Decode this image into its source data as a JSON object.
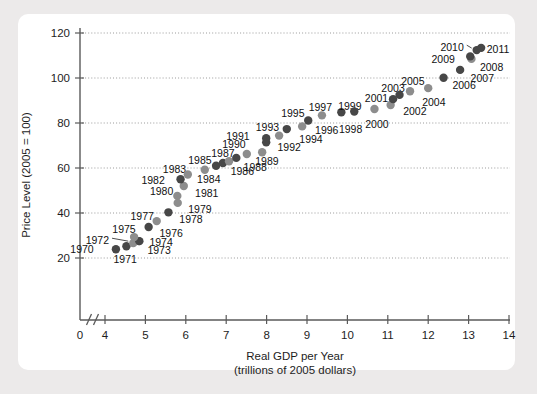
{
  "figure": {
    "background_color": "#eceaea",
    "panel_color": "#ffffff"
  },
  "chart_data": {
    "type": "scatter",
    "title": "",
    "xlabel": "Real GDP per Year",
    "xlabel_sub": "(trillions of 2005 dollars)",
    "ylabel": "Price Level (2005 = 100)",
    "xlim": [
      0,
      14
    ],
    "ylim": [
      0,
      124
    ],
    "x_axis_break": true,
    "x_break_after": 0,
    "x_data_start": 4,
    "grid": "horizontal-dotted",
    "legend": "none",
    "xticks": [
      0,
      4,
      5,
      6,
      7,
      8,
      9,
      10,
      11,
      12,
      13,
      14
    ],
    "xticklabels": [
      "0",
      "4",
      "5",
      "6",
      "7",
      "8",
      "9",
      "10",
      "11",
      "12",
      "13",
      "14"
    ],
    "yticks": [
      20,
      40,
      60,
      80,
      100,
      120
    ],
    "yticklabels": [
      "20",
      "40",
      "60",
      "80",
      "100",
      "120"
    ],
    "colors": {
      "dot_dark": "#474747",
      "dot_light": "#8d8d8d",
      "axis": "#5a5a5a",
      "grid": "#9a9a9a",
      "text": "#111111"
    },
    "points": [
      {
        "label": "1970",
        "x": 4.27,
        "y": 23.9,
        "shade": "dark",
        "lx": 3.72,
        "ly": 23.9,
        "anchor": "end",
        "leader": false
      },
      {
        "label": "1971",
        "x": 4.53,
        "y": 25.2,
        "shade": "dark",
        "lx": 4.5,
        "ly": 19.6,
        "anchor": "middle",
        "leader": false
      },
      {
        "label": "1972",
        "x": 4.7,
        "y": 26.6,
        "shade": "light",
        "lx": 4.1,
        "ly": 27.9,
        "anchor": "end",
        "leader": true
      },
      {
        "label": "1973",
        "x": 4.84,
        "y": 27.5,
        "shade": "light",
        "lx": 5.05,
        "ly": 23.6,
        "anchor": "start",
        "leader": false
      },
      {
        "label": "1974",
        "x": 4.85,
        "y": 27.5,
        "shade": "dark",
        "lx": 5.1,
        "ly": 27.3,
        "anchor": "start",
        "leader": false
      },
      {
        "label": "1975",
        "x": 4.72,
        "y": 29.3,
        "shade": "light",
        "lx": 4.47,
        "ly": 32.8,
        "anchor": "middle",
        "leader": false
      },
      {
        "label": "1976",
        "x": 5.08,
        "y": 33.8,
        "shade": "dark",
        "lx": 5.35,
        "ly": 30.9,
        "anchor": "start",
        "leader": false
      },
      {
        "label": "1977",
        "x": 5.28,
        "y": 36.4,
        "shade": "light",
        "lx": 4.92,
        "ly": 38.5,
        "anchor": "middle",
        "leader": false
      },
      {
        "label": "1978",
        "x": 5.57,
        "y": 40.3,
        "shade": "dark",
        "lx": 5.84,
        "ly": 37.4,
        "anchor": "start",
        "leader": false
      },
      {
        "label": "1979",
        "x": 5.8,
        "y": 44.5,
        "shade": "light",
        "lx": 6.06,
        "ly": 41.7,
        "anchor": "start",
        "leader": false
      },
      {
        "label": "1980",
        "x": 5.79,
        "y": 47.6,
        "shade": "light",
        "lx": 5.4,
        "ly": 49.8,
        "anchor": "middle",
        "leader": false
      },
      {
        "label": "1981",
        "x": 5.95,
        "y": 52.0,
        "shade": "light",
        "lx": 6.23,
        "ly": 49.1,
        "anchor": "start",
        "leader": false
      },
      {
        "label": "1982",
        "x": 5.87,
        "y": 55.0,
        "shade": "dark",
        "lx": 5.48,
        "ly": 54.7,
        "anchor": "end",
        "leader": false
      },
      {
        "label": "1983",
        "x": 6.05,
        "y": 57.1,
        "shade": "light",
        "lx": 5.72,
        "ly": 59.5,
        "anchor": "middle",
        "leader": false
      },
      {
        "label": "1984",
        "x": 6.47,
        "y": 59.2,
        "shade": "light",
        "lx": 6.28,
        "ly": 55.2,
        "anchor": "start",
        "leader": false
      },
      {
        "label": "1985",
        "x": 6.75,
        "y": 61.0,
        "shade": "dark",
        "lx": 6.35,
        "ly": 63.4,
        "anchor": "middle",
        "leader": false
      },
      {
        "label": "1986",
        "x": 6.92,
        "y": 62.2,
        "shade": "dark",
        "lx": 7.11,
        "ly": 58.8,
        "anchor": "start",
        "leader": false
      },
      {
        "label": "1987",
        "x": 7.07,
        "y": 63.0,
        "shade": "light",
        "lx": 6.92,
        "ly": 66.8,
        "anchor": "middle",
        "leader": false
      },
      {
        "label": "1988",
        "x": 7.25,
        "y": 64.5,
        "shade": "dark",
        "lx": 7.43,
        "ly": 60.6,
        "anchor": "start",
        "leader": false
      },
      {
        "label": "1989",
        "x": 7.51,
        "y": 66.2,
        "shade": "light",
        "lx": 7.72,
        "ly": 63.1,
        "anchor": "start",
        "leader": false
      },
      {
        "label": "1990",
        "x": 7.89,
        "y": 67.0,
        "shade": "light",
        "lx": 7.48,
        "ly": 70.5,
        "anchor": "end",
        "leader": false
      },
      {
        "label": "1991",
        "x": 7.99,
        "y": 71.4,
        "shade": "dark",
        "lx": 7.58,
        "ly": 74.4,
        "anchor": "end",
        "leader": false
      },
      {
        "label": "1992",
        "x": 7.99,
        "y": 73.2,
        "shade": "dark",
        "lx": 8.27,
        "ly": 69.5,
        "anchor": "start",
        "leader": false
      },
      {
        "label": "1993",
        "x": 8.31,
        "y": 74.4,
        "shade": "light",
        "lx": 8.02,
        "ly": 78.1,
        "anchor": "middle",
        "leader": false
      },
      {
        "label": "1994",
        "x": 8.5,
        "y": 77.3,
        "shade": "dark",
        "lx": 8.81,
        "ly": 72.7,
        "anchor": "start",
        "leader": false
      },
      {
        "label": "1995",
        "x": 9.03,
        "y": 81.1,
        "shade": "dark",
        "lx": 8.65,
        "ly": 84.3,
        "anchor": "middle",
        "leader": false
      },
      {
        "label": "1996",
        "x": 8.88,
        "y": 78.5,
        "shade": "light",
        "lx": 9.2,
        "ly": 77.1,
        "anchor": "start",
        "leader": false
      },
      {
        "label": "1997",
        "x": 9.37,
        "y": 83.4,
        "shade": "light",
        "lx": 9.33,
        "ly": 87.0,
        "anchor": "middle",
        "leader": false
      },
      {
        "label": "1998",
        "x": 9.85,
        "y": 84.8,
        "shade": "dark",
        "lx": 10.08,
        "ly": 77.4,
        "anchor": "middle",
        "leader": false
      },
      {
        "label": "1999",
        "x": 10.17,
        "y": 85.1,
        "shade": "dark",
        "lx": 10.06,
        "ly": 87.5,
        "anchor": "middle",
        "leader": false
      },
      {
        "label": "2000",
        "x": 10.67,
        "y": 86.2,
        "shade": "light",
        "lx": 10.73,
        "ly": 79.6,
        "anchor": "middle",
        "leader": false
      },
      {
        "label": "2001",
        "x": 11.07,
        "y": 88.0,
        "shade": "light",
        "lx": 10.72,
        "ly": 91.1,
        "anchor": "middle",
        "leader": false
      },
      {
        "label": "2002",
        "x": 11.13,
        "y": 90.6,
        "shade": "dark",
        "lx": 11.38,
        "ly": 85.2,
        "anchor": "start",
        "leader": false
      },
      {
        "label": "2003",
        "x": 11.29,
        "y": 92.5,
        "shade": "dark",
        "lx": 11.13,
        "ly": 95.7,
        "anchor": "middle",
        "leader": false
      },
      {
        "label": "2004",
        "x": 11.55,
        "y": 94.1,
        "shade": "light",
        "lx": 11.85,
        "ly": 89.5,
        "anchor": "start",
        "leader": false
      },
      {
        "label": "2005",
        "x": 12.0,
        "y": 95.5,
        "shade": "light",
        "lx": 11.62,
        "ly": 98.7,
        "anchor": "middle",
        "leader": false
      },
      {
        "label": "2006",
        "x": 12.38,
        "y": 100.1,
        "shade": "dark",
        "lx": 12.6,
        "ly": 96.8,
        "anchor": "start",
        "leader": false
      },
      {
        "label": "2007",
        "x": 12.79,
        "y": 103.6,
        "shade": "dark",
        "lx": 13.05,
        "ly": 99.9,
        "anchor": "start",
        "leader": false
      },
      {
        "label": "2008",
        "x": 13.07,
        "y": 108.5,
        "shade": "light",
        "lx": 13.28,
        "ly": 105.0,
        "anchor": "start",
        "leader": false
      },
      {
        "label": "2009",
        "x": 13.04,
        "y": 109.6,
        "shade": "dark",
        "lx": 12.66,
        "ly": 108.4,
        "anchor": "end",
        "leader": false
      },
      {
        "label": "2010",
        "x": 13.2,
        "y": 112.4,
        "shade": "dark",
        "lx": 12.88,
        "ly": 113.7,
        "anchor": "end",
        "leader": true
      },
      {
        "label": "2011",
        "x": 13.31,
        "y": 113.4,
        "shade": "dark",
        "lx": 13.45,
        "ly": 112.9,
        "anchor": "start",
        "leader": false
      }
    ]
  }
}
